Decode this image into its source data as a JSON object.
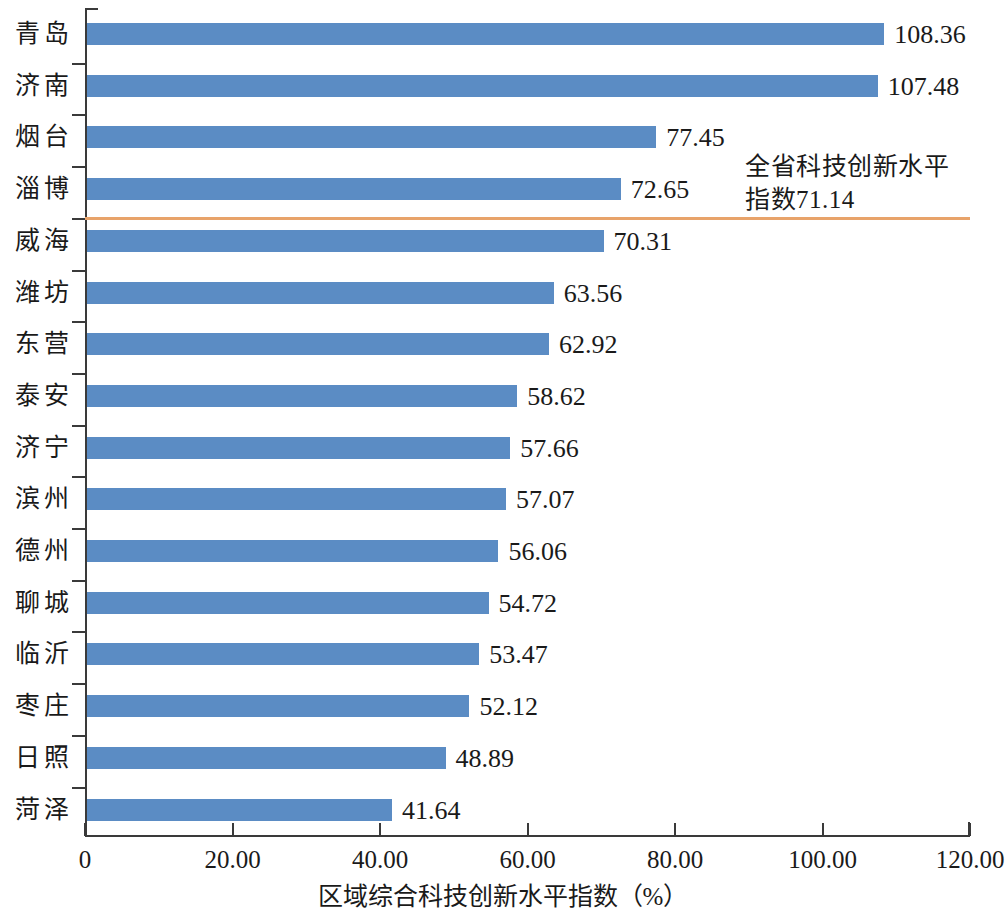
{
  "chart_data": {
    "type": "bar",
    "orientation": "horizontal",
    "title": "",
    "xlabel": "区域综合科技创新水平指数（%）",
    "ylabel": "",
    "xlim": [
      0,
      120
    ],
    "xticks": [
      "0",
      "20.00",
      "40.00",
      "60.00",
      "80.00",
      "100.00",
      "120.00"
    ],
    "xtick_values": [
      0,
      20,
      40,
      60,
      80,
      100,
      120
    ],
    "grid": false,
    "legend": "none",
    "bar_color": "#5b8cc4",
    "categories": [
      "青岛",
      "济南",
      "烟台",
      "淄博",
      "威海",
      "潍坊",
      "东营",
      "泰安",
      "济宁",
      "滨州",
      "德州",
      "聊城",
      "临沂",
      "枣庄",
      "日照",
      "菏泽"
    ],
    "values": [
      108.36,
      107.48,
      77.45,
      72.65,
      70.31,
      63.56,
      62.92,
      58.62,
      57.66,
      57.07,
      56.06,
      54.72,
      53.47,
      52.12,
      48.89,
      41.64
    ],
    "value_labels": [
      "108.36",
      "107.48",
      "77.45",
      "72.65",
      "70.31",
      "63.56",
      "62.92",
      "58.62",
      "57.66",
      "57.07",
      "56.06",
      "54.72",
      "53.47",
      "52.12",
      "48.89",
      "41.64"
    ],
    "reference_line": {
      "value": 71.14,
      "color": "#e8a36a",
      "annotation": "全省科技创新水平\n指数71.14"
    }
  }
}
